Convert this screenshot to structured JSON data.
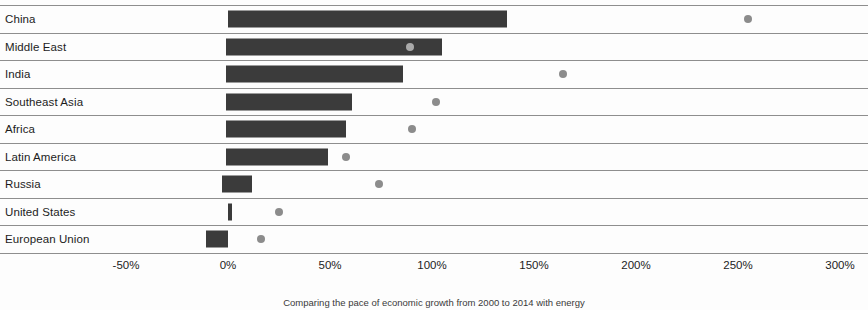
{
  "chart_data": {
    "type": "bar",
    "title": "",
    "subtitle": "",
    "caption": "Comparing the pace of economic growth from 2000 to 2014 with energy",
    "xlabel": "",
    "ylabel": "",
    "xlim": [
      -75,
      313
    ],
    "xticks": [
      -50,
      0,
      50,
      100,
      150,
      200,
      250,
      300
    ],
    "xticklabels": [
      "-50%",
      "0%",
      "50%",
      "100%",
      "150%",
      "200%",
      "250%",
      "300%"
    ],
    "grid": true,
    "grid_orientation": "horizontal",
    "legend": "none",
    "categories": [
      "China",
      "Middle East",
      "India",
      "Southeast Asia",
      "Africa",
      "Latin America",
      "Russia",
      "United States",
      "European Union"
    ],
    "series": [
      {
        "name": "bar",
        "type": "bar",
        "color": "#3b3b3b",
        "values": [
          137,
          105,
          86,
          61,
          58,
          49,
          12,
          2,
          -11
        ],
        "starts": [
          0,
          -1,
          -1,
          -1,
          -1,
          -1,
          -3,
          0,
          -11
        ]
      },
      {
        "name": "marker",
        "type": "scatter",
        "color": "#8c8c8c",
        "values": [
          255,
          89,
          164,
          102,
          90,
          58,
          74,
          25,
          16
        ]
      }
    ]
  },
  "axis": {
    "ticks": [
      {
        "label": "-50%",
        "value": -50
      },
      {
        "label": "0%",
        "value": 0
      },
      {
        "label": "50%",
        "value": 50
      },
      {
        "label": "100%",
        "value": 100
      },
      {
        "label": "150%",
        "value": 150
      },
      {
        "label": "200%",
        "value": 200
      },
      {
        "label": "250%",
        "value": 250
      },
      {
        "label": "300%",
        "value": 300
      }
    ]
  },
  "rows": [
    {
      "label": "China",
      "bar_start": 0,
      "bar_end": 137,
      "dot": 255,
      "dot_on_bar": false
    },
    {
      "label": "Middle East",
      "bar_start": -1,
      "bar_end": 105,
      "dot": 89,
      "dot_on_bar": true
    },
    {
      "label": "India",
      "bar_start": -1,
      "bar_end": 86,
      "dot": 164,
      "dot_on_bar": false
    },
    {
      "label": "Southeast Asia",
      "bar_start": -1,
      "bar_end": 61,
      "dot": 102,
      "dot_on_bar": false
    },
    {
      "label": "Africa",
      "bar_start": -1,
      "bar_end": 58,
      "dot": 90,
      "dot_on_bar": false
    },
    {
      "label": "Latin America",
      "bar_start": -1,
      "bar_end": 49,
      "dot": 58,
      "dot_on_bar": false
    },
    {
      "label": "Russia",
      "bar_start": -3,
      "bar_end": 12,
      "dot": 74,
      "dot_on_bar": false
    },
    {
      "label": "United States",
      "bar_start": 0,
      "bar_end": 2,
      "dot": 25,
      "dot_on_bar": false
    },
    {
      "label": "European Union",
      "bar_start": -11,
      "bar_end": 0,
      "dot": 16,
      "dot_on_bar": false
    }
  ],
  "caption": {
    "text": "Comparing the pace of economic growth from 2000 to 2014 with energy"
  },
  "colors": {
    "bar": "#3b3b3b",
    "dot": "#8c8c8c",
    "dot_on_bar": "#a9a9a9",
    "gridline": "#8e8e8e",
    "background": "#fdfdfd",
    "text": "#1c1c1c"
  }
}
